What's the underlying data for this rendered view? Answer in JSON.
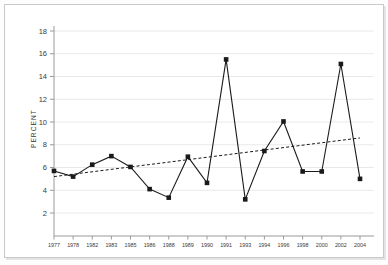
{
  "chart_data": {
    "type": "line",
    "title": "",
    "xlabel": "",
    "ylabel": "PERCENT",
    "categories": [
      "1977",
      "1978",
      "1982",
      "1983",
      "1985",
      "1986",
      "1988",
      "1989",
      "1990",
      "1991",
      "1993",
      "1994",
      "1996",
      "1998",
      "2000",
      "2002",
      "2004"
    ],
    "values": [
      5.7,
      5.2,
      6.25,
      7.0,
      6.05,
      4.1,
      3.35,
      6.95,
      4.65,
      15.5,
      3.2,
      7.45,
      10.05,
      5.65,
      5.65,
      15.1,
      5.0
    ],
    "series": [
      {
        "name": "Percent",
        "style": "solid-with-square-markers",
        "color": "#1a1a1a",
        "values": [
          5.7,
          5.2,
          6.25,
          7.0,
          6.05,
          4.1,
          3.35,
          6.95,
          4.65,
          15.5,
          3.2,
          7.45,
          10.05,
          5.65,
          5.65,
          15.1,
          5.0
        ]
      },
      {
        "name": "Trend",
        "style": "dashed",
        "color": "#1a1a1a",
        "x": [
          "1977",
          "2004"
        ],
        "values": [
          5.2,
          8.6
        ]
      }
    ],
    "ytick_labels": [
      "2",
      "4",
      "6",
      "8",
      "10",
      "12",
      "14",
      "16",
      "18"
    ],
    "ytick_values": [
      2,
      4,
      6,
      8,
      10,
      12,
      14,
      16,
      18
    ],
    "ylim": [
      0,
      18
    ],
    "xlim_labels": [
      "1977",
      "2004"
    ],
    "grid": "horizontal",
    "gridline_color": "#e8e8e8",
    "axis_color": "#9a9a9a",
    "legend": "none",
    "legend_position": "none",
    "marker": "square",
    "background_color": "#ffffff",
    "border_color": "#c9c9c9"
  },
  "axis": {
    "y_label": "PERCENT"
  }
}
